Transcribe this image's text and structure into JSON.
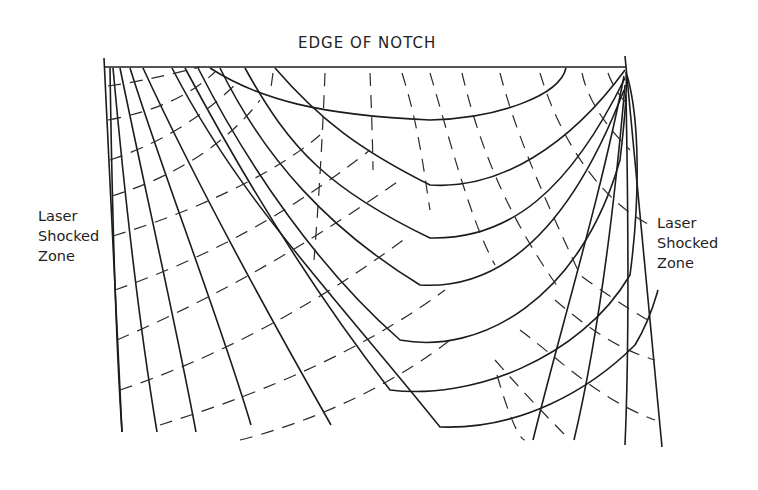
{
  "diagram": {
    "title": "EDGE OF NOTCH",
    "left_label": [
      "Laser",
      "Shocked",
      "Zone"
    ],
    "right_label": [
      "Laser",
      "Shocked",
      "Zone"
    ],
    "line_color": "#1c1c1c",
    "background": "#ffffff"
  }
}
